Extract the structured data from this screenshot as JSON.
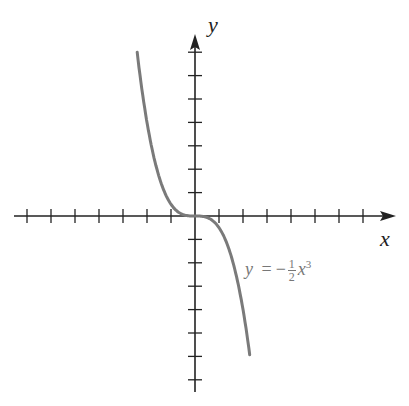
{
  "chart_data": {
    "type": "line",
    "title": "",
    "xlabel": "x",
    "ylabel": "y",
    "equation": "y = -1/2 x^3",
    "equation_parts": {
      "lhs": "y",
      "eq": "=",
      "sign": "−",
      "num": "1",
      "den": "2",
      "var": "x",
      "exp": "3"
    },
    "xlim": [
      -7,
      8
    ],
    "ylim": [
      -7.5,
      8
    ],
    "x_ticks": [
      -7,
      -6,
      -5,
      -4,
      -3,
      -2,
      -1,
      1,
      2,
      3,
      4,
      5,
      6,
      7
    ],
    "y_ticks": [
      -7,
      -6,
      -5,
      -4,
      -3,
      -2,
      -1,
      1,
      2,
      3,
      4,
      5,
      6,
      7
    ],
    "tick_labels_shown": false,
    "grid": false,
    "series": [
      {
        "name": "y = -1/2 x^3",
        "color": "#7a7a7a",
        "x": [
          -2.41,
          -2,
          -1.5,
          -1,
          -0.5,
          0,
          0.5,
          1,
          1.5,
          2,
          2.28
        ],
        "y": [
          7.0,
          4.0,
          1.69,
          0.5,
          0.06,
          0,
          -0.06,
          -0.5,
          -1.69,
          -4.0,
          -5.93
        ]
      }
    ]
  },
  "colors": {
    "axis": "#222222",
    "curve": "#7a7a7a"
  }
}
